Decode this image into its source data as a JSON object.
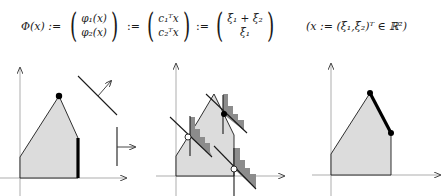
{
  "formula": {
    "lhs": "Φ(x) :=",
    "vec1": [
      "φ₁(x)",
      "φ₂(x)"
    ],
    "assign1": ":=",
    "vec2": [
      "c₁ᵀx",
      "c₂ᵀx"
    ],
    "assign2": ":=",
    "vec3": [
      "ξ₁ + ξ₂",
      "ξ₁"
    ],
    "note": "(x := (ξ₁,ξ₂)ᵀ ∈ ℝ²)"
  },
  "colors": {
    "region_fill": "#dcdcdc",
    "cone_fill": "#8c8c8c",
    "line": "#1a1a1a",
    "axis": "#7a7a7a",
    "background": "#ffffff"
  },
  "panels": [
    {
      "name": "panel-1-feasible-region-with-normals",
      "polygon": [
        [
          20,
          178
        ],
        [
          20,
          157
        ],
        [
          59,
          96
        ],
        [
          78,
          138
        ],
        [
          78,
          178
        ]
      ],
      "optimal_vertex": [
        59,
        96
      ],
      "thick_edge": [
        [
          78,
          138
        ],
        [
          78,
          178
        ]
      ],
      "normals": [
        {
          "line": [
            [
              78,
              76
            ],
            [
              117,
              115
            ]
          ],
          "arrow": [
            [
              98,
              96
            ],
            [
              111,
              81
            ]
          ]
        },
        {
          "line": [
            [
              117,
              127
            ],
            [
              117,
              166
            ]
          ],
          "arrow": [
            [
              117,
              147
            ],
            [
              135,
              147
            ]
          ]
        }
      ]
    },
    {
      "name": "panel-2-cones-at-vertices",
      "polygon": [
        [
          176,
          176
        ],
        [
          176,
          156
        ],
        [
          214,
          94
        ],
        [
          234,
          135
        ],
        [
          234,
          176
        ]
      ],
      "points": [
        {
          "pos": [
            188,
            137
          ],
          "type": "open"
        },
        {
          "pos": [
            224,
            114
          ],
          "type": "filled"
        },
        {
          "pos": [
            234,
            169
          ],
          "type": "open"
        }
      ]
    },
    {
      "name": "panel-3-optimal-edge",
      "polygon": [
        [
          331,
          175
        ],
        [
          331,
          154
        ],
        [
          370,
          93
        ],
        [
          391,
          133
        ],
        [
          391,
          175
        ]
      ],
      "thick_edge": [
        [
          370,
          93
        ],
        [
          391,
          133
        ]
      ],
      "endpoints": [
        [
          370,
          93
        ],
        [
          391,
          133
        ]
      ]
    }
  ]
}
